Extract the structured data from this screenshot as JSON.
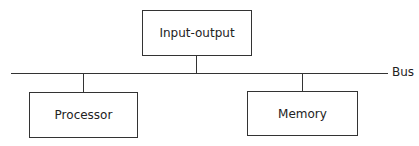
{
  "diagram": {
    "bus_label": "Bus",
    "nodes": [
      {
        "id": "io",
        "label": "Input-output"
      },
      {
        "id": "processor",
        "label": "Processor"
      },
      {
        "id": "memory",
        "label": "Memory"
      }
    ],
    "edges": [
      {
        "from": "io",
        "to": "bus"
      },
      {
        "from": "processor",
        "to": "bus"
      },
      {
        "from": "memory",
        "to": "bus"
      }
    ]
  }
}
